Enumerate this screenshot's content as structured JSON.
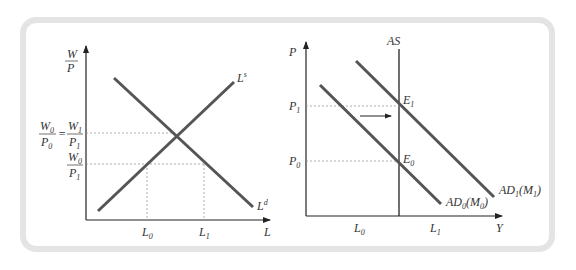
{
  "left_panel": {
    "y_axis_label_num": "W",
    "y_axis_label_den": "P",
    "x_axis_label": "L",
    "supply_curve": {
      "base": "L",
      "sup": "s"
    },
    "demand_curve": {
      "base": "L",
      "sup": "d"
    },
    "y_tick_1": {
      "num_a": "W",
      "num_a_sub": "0",
      "den_a": "P",
      "den_a_sub": "0",
      "eq": "=",
      "num_b": "W",
      "num_b_sub": "1",
      "den_b": "P",
      "den_b_sub": "1"
    },
    "y_tick_2": {
      "num": "W",
      "num_sub": "0",
      "den": "P",
      "den_sub": "1"
    },
    "x_tick_0": {
      "base": "L",
      "sub": "0"
    },
    "x_tick_1": {
      "base": "L",
      "sub": "1"
    }
  },
  "right_panel": {
    "y_axis_label": "P",
    "x_axis_label": "Y",
    "as_label": "AS",
    "p1": {
      "base": "P",
      "sub": "1"
    },
    "p0": {
      "base": "P",
      "sub": "0"
    },
    "e1": {
      "base": "E",
      "sub": "1"
    },
    "e0": {
      "base": "E",
      "sub": "0"
    },
    "ad0": {
      "a": "AD",
      "a_sub": "0",
      "m": "(M",
      "m_sub": "0",
      "close": ")"
    },
    "ad1": {
      "a": "AD",
      "a_sub": "1",
      "m": "(M",
      "m_sub": "1",
      "close": ")"
    },
    "x_tick_0": {
      "base": "L",
      "sub": "0"
    },
    "x_tick_1": {
      "base": "L",
      "sub": "1"
    }
  },
  "colors": {
    "frame": "#e4e4e4",
    "curve": "#555555",
    "axis": "#222222",
    "dotted": "#999999"
  }
}
